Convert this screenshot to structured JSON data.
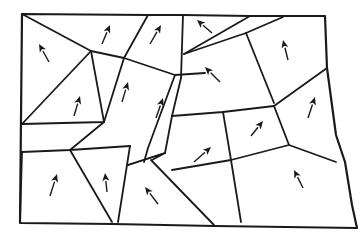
{
  "diagram": {
    "stroke_color": "#1a1a1a",
    "background": "#ffffff",
    "outer_boundary": [
      [
        22,
        14
      ],
      [
        148,
        15
      ],
      [
        183,
        15
      ],
      [
        250,
        16
      ],
      [
        325,
        16
      ],
      [
        327,
        68
      ],
      [
        336,
        135
      ],
      [
        345,
        162
      ],
      [
        352,
        205
      ],
      [
        357,
        228
      ],
      [
        215,
        226
      ],
      [
        113,
        224
      ],
      [
        20,
        223
      ]
    ],
    "edges": [
      [
        [
          22,
          14
        ],
        [
          91,
          51
        ],
        [
          124,
          58
        ],
        [
          175,
          75
        ],
        [
          205,
          73
        ]
      ],
      [
        [
          148,
          15
        ],
        [
          124,
          58
        ]
      ],
      [
        [
          183,
          15
        ],
        [
          181,
          78
        ]
      ],
      [
        [
          91,
          51
        ],
        [
          104,
          122
        ],
        [
          22,
          124
        ]
      ],
      [
        [
          91,
          51
        ],
        [
          22,
          124
        ]
      ],
      [
        [
          124,
          58
        ],
        [
          104,
          122
        ]
      ],
      [
        [
          175,
          75
        ],
        [
          162,
          110
        ],
        [
          148,
          148
        ],
        [
          144,
          162
        ]
      ],
      [
        [
          181,
          78
        ],
        [
          172,
          116
        ],
        [
          165,
          153
        ]
      ],
      [
        [
          250,
          16
        ],
        [
          184,
          54
        ]
      ],
      [
        [
          283,
          17
        ],
        [
          246,
          33
        ],
        [
          274,
          103
        ]
      ],
      [
        [
          246,
          33
        ],
        [
          184,
          54
        ]
      ],
      [
        [
          172,
          116
        ],
        [
          223,
          112
        ],
        [
          274,
          106
        ]
      ],
      [
        [
          274,
          106
        ],
        [
          327,
          68
        ]
      ],
      [
        [
          274,
          106
        ],
        [
          289,
          145
        ],
        [
          336,
          162
        ]
      ],
      [
        [
          223,
          112
        ],
        [
          231,
          160
        ],
        [
          289,
          145
        ]
      ],
      [
        [
          231,
          160
        ],
        [
          241,
          222
        ]
      ],
      [
        [
          104,
          122
        ],
        [
          70,
          150
        ]
      ],
      [
        [
          22,
          152
        ],
        [
          70,
          150
        ],
        [
          130,
          146
        ]
      ],
      [
        [
          70,
          150
        ],
        [
          112,
          222
        ]
      ],
      [
        [
          130,
          146
        ],
        [
          118,
          222
        ]
      ],
      [
        [
          128,
          165
        ],
        [
          165,
          153
        ]
      ],
      [
        [
          128,
          165
        ],
        [
          165,
          153
        ],
        [
          152,
          160
        ]
      ],
      [
        [
          151,
          160
        ],
        [
          214,
          225
        ]
      ],
      [
        [
          231,
          160
        ],
        [
          172,
          170
        ]
      ],
      [
        [
          22,
          152
        ],
        [
          20,
          222
        ]
      ]
    ],
    "arrows": [
      {
        "cell": 1,
        "from": [
          49,
          62
        ],
        "to": [
          39,
          44
        ]
      },
      {
        "cell": 2,
        "from": [
          102,
          44
        ],
        "to": [
          110,
          25
        ]
      },
      {
        "cell": 3,
        "from": [
          150,
          44
        ],
        "to": [
          161,
          25
        ]
      },
      {
        "cell": 4,
        "from": [
          212,
          33
        ],
        "to": [
          197,
          20
        ]
      },
      {
        "cell": 5,
        "from": [
          288,
          60
        ],
        "to": [
          283,
          40
        ]
      },
      {
        "cell": 6,
        "from": [
          220,
          82
        ],
        "to": [
          205,
          67
        ]
      },
      {
        "cell": 7,
        "from": [
          74,
          116
        ],
        "to": [
          80,
          96
        ]
      },
      {
        "cell": 8,
        "from": [
          122,
          102
        ],
        "to": [
          128,
          82
        ]
      },
      {
        "cell": 9,
        "from": [
          156,
          118
        ],
        "to": [
          163,
          98
        ]
      },
      {
        "cell": 10,
        "from": [
          308,
          118
        ],
        "to": [
          315,
          97
        ]
      },
      {
        "cell": 11,
        "from": [
          251,
          136
        ],
        "to": [
          263,
          121
        ]
      },
      {
        "cell": 12,
        "from": [
          194,
          162
        ],
        "to": [
          211,
          147
        ]
      },
      {
        "cell": 13,
        "from": [
          50,
          196
        ],
        "to": [
          57,
          174
        ]
      },
      {
        "cell": 14,
        "from": [
          107,
          192
        ],
        "to": [
          105,
          173
        ]
      },
      {
        "cell": 15,
        "from": [
          158,
          204
        ],
        "to": [
          145,
          187
        ]
      },
      {
        "cell": 16,
        "from": [
          303,
          188
        ],
        "to": [
          294,
          170
        ]
      }
    ]
  }
}
